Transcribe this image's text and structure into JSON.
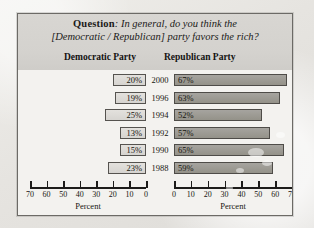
{
  "figure": {
    "question_label": "Question",
    "question_line1": ": In general, do you think the",
    "question_line2": "[Democratic / Republican] party favors the rich?",
    "left_header": "Democratic Party",
    "right_header": "Republican Party",
    "left_axis_caption": "Percent",
    "right_axis_caption": "Percent"
  },
  "chart_data": {
    "type": "bar",
    "title": "Question: In general, do you think the [Democratic / Republican] party favors the rich?",
    "orientation": "horizontal",
    "layout": "mirrored-pyramid",
    "categories": [
      "2000",
      "1996",
      "1994",
      "1992",
      "1990",
      "1988"
    ],
    "xlabel": "Percent",
    "ylabel": "",
    "grid": false,
    "legend": "none",
    "series": [
      {
        "name": "Democratic Party",
        "side": "left",
        "values": [
          20,
          19,
          25,
          13,
          15,
          23
        ],
        "labels": [
          "20%",
          "19%",
          "25%",
          "13%",
          "15%",
          "23%"
        ],
        "xlim": [
          70,
          0
        ],
        "ticks": [
          70,
          60,
          50,
          40,
          30,
          20,
          10,
          0
        ],
        "tick_labels": [
          "70",
          "60",
          "50",
          "40",
          "30",
          "20",
          "10",
          "0"
        ]
      },
      {
        "name": "Republican Party",
        "side": "right",
        "values": [
          67,
          63,
          52,
          57,
          65,
          59
        ],
        "labels": [
          "67%",
          "63%",
          "52%",
          "57%",
          "65%",
          "59%"
        ],
        "xlim": [
          0,
          70
        ],
        "ticks": [
          0,
          10,
          20,
          30,
          40,
          50,
          60,
          70
        ],
        "tick_labels": [
          "0",
          "10",
          "20",
          "30",
          "40",
          "50",
          "60",
          "70"
        ]
      }
    ]
  },
  "colors": {
    "panel_background": "#f3f2ef",
    "header_band": "#d4d2ce",
    "left_bar_fill": "#ded c d8",
    "right_bar_fill": "#9c9a94",
    "border": "#55534f",
    "text": "#17160f"
  }
}
